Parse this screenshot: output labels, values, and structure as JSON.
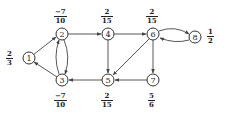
{
  "diagram": {
    "type": "directed-graph",
    "nodes": [
      {
        "id": "1",
        "label": "1",
        "value_num": "2",
        "value_den": "3"
      },
      {
        "id": "2",
        "label": "2",
        "value_num": "−7",
        "value_den": "10"
      },
      {
        "id": "3",
        "label": "3",
        "value_num": "−7",
        "value_den": "10"
      },
      {
        "id": "4",
        "label": "4",
        "value_num": "2",
        "value_den": "15"
      },
      {
        "id": "5",
        "label": "5",
        "value_num": "2",
        "value_den": "15"
      },
      {
        "id": "6",
        "label": "6",
        "value_num": "2",
        "value_den": "15"
      },
      {
        "id": "7",
        "label": "7",
        "value_num": "5",
        "value_den": "6"
      },
      {
        "id": "8",
        "label": "8",
        "value_num": "1",
        "value_den": "2"
      }
    ],
    "edges": [
      {
        "from": "1",
        "to": "2"
      },
      {
        "from": "3",
        "to": "1"
      },
      {
        "from": "2",
        "to": "3"
      },
      {
        "from": "3",
        "to": "2"
      },
      {
        "from": "2",
        "to": "4"
      },
      {
        "from": "4",
        "to": "5"
      },
      {
        "from": "4",
        "to": "6"
      },
      {
        "from": "5",
        "to": "3"
      },
      {
        "from": "6",
        "to": "5"
      },
      {
        "from": "6",
        "to": "7"
      },
      {
        "from": "7",
        "to": "5"
      },
      {
        "from": "6",
        "to": "8"
      },
      {
        "from": "8",
        "to": "6"
      }
    ]
  }
}
